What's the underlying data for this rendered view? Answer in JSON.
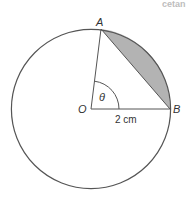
{
  "diagram": {
    "type": "circle-sector-segment",
    "colors": {
      "line": "#555555",
      "shaded_segment": "#b3b3b3",
      "background": "#ffffff",
      "text": "#333333"
    },
    "points": {
      "A": {
        "label": "A"
      },
      "O": {
        "label": "O"
      },
      "B": {
        "label": "B"
      }
    },
    "angle_label": "θ",
    "radius_label": "2 cm",
    "cropped_header_fragment": "cetan"
  }
}
